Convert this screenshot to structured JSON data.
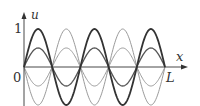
{
  "chart_data": {
    "type": "line",
    "title": "",
    "xlabel": "x",
    "ylabel": "u",
    "x_ticks": [
      "0",
      "L"
    ],
    "y_ticks": [
      "1"
    ],
    "xlim": [
      0,
      1
    ],
    "ylim": [
      -1,
      1
    ],
    "grid": false,
    "legend": null,
    "x_domain_note": "x from 0 to L; 5 half-wavelengths (u = A·sin(5πx/L))",
    "series": [
      {
        "name": "A = 1",
        "amplitude": 1,
        "mode": 5,
        "color": "#333333",
        "width": 1.8
      },
      {
        "name": "A = 0.5",
        "amplitude": 0.5,
        "mode": 5,
        "color": "#555555",
        "width": 1.3
      },
      {
        "name": "A = -0.5",
        "amplitude": -0.5,
        "mode": 5,
        "color": "#9a9a9a",
        "width": 1.0
      },
      {
        "name": "A = -1",
        "amplitude": -1,
        "mode": 5,
        "color": "#9a9a9a",
        "width": 1.0
      }
    ]
  },
  "labels": {
    "y_axis": "u",
    "x_axis": "x",
    "origin": "0",
    "x_end": "L",
    "y_one": "1"
  }
}
